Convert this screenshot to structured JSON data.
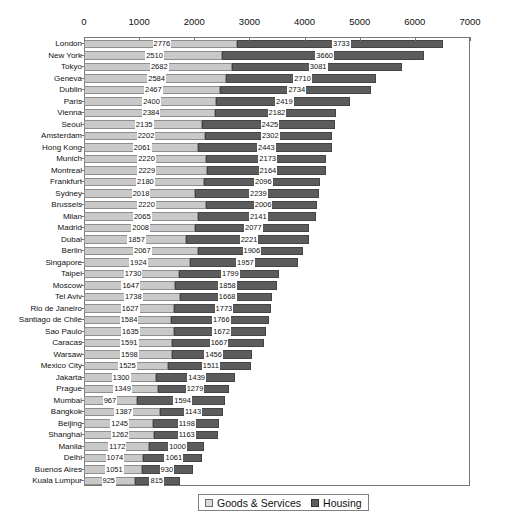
{
  "chart_data": {
    "type": "bar",
    "orientation": "horizontal",
    "stacked": true,
    "title": "",
    "subtitle": "",
    "xlabel": "",
    "ylabel": "",
    "xlim": [
      0,
      7000
    ],
    "xticks": [
      0,
      1000,
      2000,
      3000,
      4000,
      5000,
      6000,
      7000
    ],
    "grid": false,
    "legend_position": "bottom",
    "legend": [
      "Goods & Services",
      "Housing"
    ],
    "colors": {
      "goods": "#c9c9c9",
      "housing": "#5c5c5c",
      "axis": "#777777",
      "text": "#111111",
      "background": "#ffffff"
    },
    "categories": [
      "London",
      "New York",
      "Tokyo",
      "Geneva",
      "Dublin",
      "Paris",
      "Vienna",
      "Seoul",
      "Amsterdam",
      "Hong Kong",
      "Munich",
      "Montreal",
      "Frankfurt",
      "Sydney",
      "Brussels",
      "Milan",
      "Madrid",
      "Dubai",
      "Berlin",
      "Singapore",
      "Taipei",
      "Moscow",
      "Tel Aviv",
      "Rio de Janeiro",
      "Santiago de Chile",
      "Sao Paulo",
      "Caracas",
      "Warsaw",
      "Mexico City",
      "Jakarta",
      "Prague",
      "Mumbai",
      "Bangkok",
      "Beijing",
      "Shanghai",
      "Manila",
      "Delhi",
      "Buenos Aires",
      "Kuala Lumpur"
    ],
    "series": [
      {
        "name": "Goods & Services",
        "values": [
          2776,
          2510,
          2682,
          2584,
          2467,
          2400,
          2384,
          2135,
          2202,
          2061,
          2220,
          2229,
          2180,
          2018,
          2220,
          2065,
          2008,
          1857,
          2067,
          1924,
          1730,
          1647,
          1738,
          1627,
          1584,
          1635,
          1591,
          1598,
          1525,
          1300,
          1349,
          967,
          1387,
          1245,
          1262,
          1172,
          1074,
          1051,
          925
        ]
      },
      {
        "name": "Housing",
        "values": [
          3733,
          3660,
          3081,
          2710,
          2734,
          2419,
          2182,
          2425,
          2302,
          2443,
          2173,
          2164,
          2096,
          2239,
          2006,
          2141,
          2077,
          2221,
          1906,
          1957,
          1799,
          1858,
          1668,
          1773,
          1766,
          1672,
          1667,
          1456,
          1511,
          1439,
          1279,
          1594,
          1143,
          1198,
          1163,
          1000,
          1061,
          930,
          815
        ]
      }
    ]
  }
}
